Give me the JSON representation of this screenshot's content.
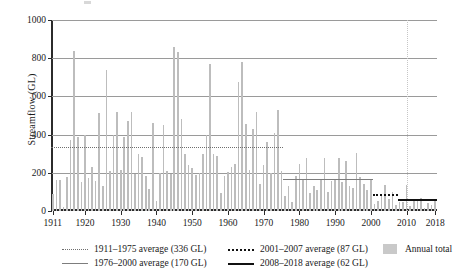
{
  "chart_data": {
    "type": "bar",
    "title": "",
    "xlabel": "",
    "ylabel": "Streamflow (GL)",
    "ylim": [
      0,
      1000
    ],
    "xlim": [
      1911,
      2018
    ],
    "yticks": [
      0,
      200,
      400,
      600,
      800,
      1000
    ],
    "xticks": [
      1911,
      1920,
      1930,
      1940,
      1950,
      1960,
      1970,
      1980,
      1990,
      2000,
      2010,
      2018
    ],
    "grid": "horizontal",
    "legend_position": "bottom",
    "series_name": "Annual total",
    "bar_color": "#bdbdbd",
    "x": [
      1911,
      1912,
      1913,
      1914,
      1915,
      1916,
      1917,
      1918,
      1919,
      1920,
      1921,
      1922,
      1923,
      1924,
      1925,
      1926,
      1927,
      1928,
      1929,
      1930,
      1931,
      1932,
      1933,
      1934,
      1935,
      1936,
      1937,
      1938,
      1939,
      1940,
      1941,
      1942,
      1943,
      1944,
      1945,
      1946,
      1947,
      1948,
      1949,
      1950,
      1951,
      1952,
      1953,
      1954,
      1955,
      1956,
      1957,
      1958,
      1959,
      1960,
      1961,
      1962,
      1963,
      1964,
      1965,
      1966,
      1967,
      1968,
      1969,
      1970,
      1971,
      1972,
      1973,
      1974,
      1975,
      1976,
      1977,
      1978,
      1979,
      1980,
      1981,
      1982,
      1983,
      1984,
      1985,
      1986,
      1987,
      1988,
      1989,
      1990,
      1991,
      1992,
      1993,
      1994,
      1995,
      1996,
      1997,
      1998,
      1999,
      2000,
      2001,
      2002,
      2003,
      2004,
      2005,
      2006,
      2007,
      2008,
      2009,
      2010,
      2011,
      2012,
      2013,
      2014,
      2015,
      2016,
      2017,
      2018
    ],
    "values": [
      90,
      165,
      160,
      20,
      180,
      370,
      840,
      390,
      150,
      400,
      175,
      232,
      155,
      515,
      130,
      740,
      210,
      400,
      520,
      215,
      385,
      470,
      520,
      195,
      300,
      285,
      182,
      115,
      460,
      55,
      200,
      448,
      210,
      195,
      858,
      835,
      480,
      300,
      240,
      225,
      190,
      200,
      300,
      400,
      770,
      298,
      290,
      95,
      185,
      205,
      230,
      245,
      675,
      780,
      455,
      215,
      430,
      520,
      140,
      240,
      360,
      200,
      408,
      530,
      212,
      80,
      130,
      45,
      185,
      248,
      165,
      275,
      95,
      130,
      110,
      165,
      275,
      102,
      155,
      170,
      275,
      150,
      260,
      130,
      122,
      305,
      178,
      140,
      108,
      168,
      35,
      55,
      90,
      138,
      62,
      98,
      30,
      48,
      45,
      138,
      28,
      55,
      50,
      70,
      18,
      40,
      30,
      58
    ],
    "average_lines": [
      {
        "key": "avg_1911_1975",
        "label": "1911–1975 average (336 GL)",
        "value": 336,
        "start_year": 1911,
        "end_year": 1975,
        "style": "dotted-thin",
        "color": "#6f6f6f"
      },
      {
        "key": "avg_1976_2000",
        "label": "1976–2000 average (170 GL)",
        "value": 170,
        "start_year": 1976,
        "end_year": 2000,
        "style": "solid-gray",
        "color": "#7d7d7d"
      },
      {
        "key": "avg_2001_2007",
        "label": "2001–2007 average (87 GL)",
        "value": 87,
        "start_year": 2001,
        "end_year": 2007,
        "style": "dotted-thick",
        "color": "#111111"
      },
      {
        "key": "avg_2008_2018",
        "label": "2008–2018 average (62 GL)",
        "value": 62,
        "start_year": 2008,
        "end_year": 2018,
        "style": "solid-black",
        "color": "#111111"
      }
    ],
    "vertical_guide_year": 2010,
    "legend": [
      {
        "label": "1911–1975 average (336 GL)",
        "marker": "dotted-thin"
      },
      {
        "label": "1976–2000 average (170 GL)",
        "marker": "solid-gray"
      },
      {
        "label": "2001–2007 average (87 GL)",
        "marker": "dotted-thick"
      },
      {
        "label": "2008–2018 average (62 GL)",
        "marker": "solid-black"
      },
      {
        "label": "Annual total",
        "marker": "box"
      }
    ]
  },
  "axes": {
    "y_title": "Streamflow (GL)",
    "y_tick_labels": [
      "0",
      "200",
      "400",
      "600",
      "800",
      "1000"
    ],
    "x_tick_labels": [
      "1911",
      "1920",
      "1930",
      "1940",
      "1950",
      "1960",
      "1970",
      "1980",
      "1990",
      "2000",
      "2010",
      "2018"
    ]
  },
  "legend_labels": {
    "item0": "1911–1975 average (336 GL)",
    "item1": "1976–2000 average (170 GL)",
    "item2": "2001–2007 average (87 GL)",
    "item3": "2008–2018 average (62 GL)",
    "item4": "Annual total"
  }
}
